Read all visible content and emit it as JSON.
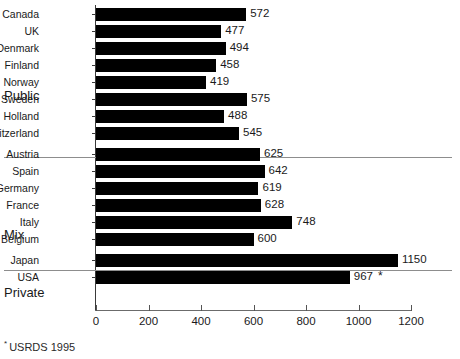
{
  "chart_data": {
    "type": "bar",
    "orientation": "horizontal",
    "title": "",
    "xlabel": "",
    "ylabel": "",
    "xlim": [
      0,
      1200
    ],
    "xticks": [
      0,
      200,
      400,
      600,
      800,
      1000,
      1200
    ],
    "xtick_labels": [
      "0",
      "200",
      "400",
      "600",
      "800",
      "1000",
      "1200"
    ],
    "grid": false,
    "legend": null,
    "bar_color": "#000000",
    "background_color": "#ffffff",
    "categories": [
      "Canada",
      "UK",
      "Denmark",
      "Finland",
      "Norway",
      "Sweden",
      "Holland",
      "Switzerland",
      "Austria",
      "Spain",
      "Germany",
      "France",
      "Italy",
      "Belgium",
      "Japan",
      "USA"
    ],
    "values": [
      572,
      477,
      494,
      458,
      419,
      575,
      488,
      545,
      625,
      642,
      619,
      628,
      748,
      600,
      1150,
      967
    ],
    "value_labels": [
      "572",
      "477",
      "494",
      "458",
      "419",
      "575",
      "488",
      "545",
      "625",
      "642",
      "619",
      "628",
      "748",
      "600",
      "1150",
      "967"
    ],
    "annotations": [
      {
        "category": "USA",
        "marker": "*"
      }
    ],
    "groups": [
      {
        "label": "Public",
        "categories": [
          "Canada",
          "UK",
          "Denmark",
          "Finland",
          "Norway",
          "Sweden",
          "Holland",
          "Switzerland"
        ]
      },
      {
        "label": "Mix",
        "categories": [
          "Austria",
          "Spain",
          "Germany",
          "France",
          "Italy",
          "Belgium"
        ]
      },
      {
        "label": "Private",
        "categories": [
          "Japan",
          "USA"
        ]
      }
    ],
    "footnote": {
      "mark": "*",
      "text": "USRDS 1995"
    }
  },
  "groups": {
    "public": "Public",
    "mix": "Mix",
    "private": "Private"
  },
  "footnote": {
    "mark": "*",
    "text": "USRDS 1995"
  }
}
